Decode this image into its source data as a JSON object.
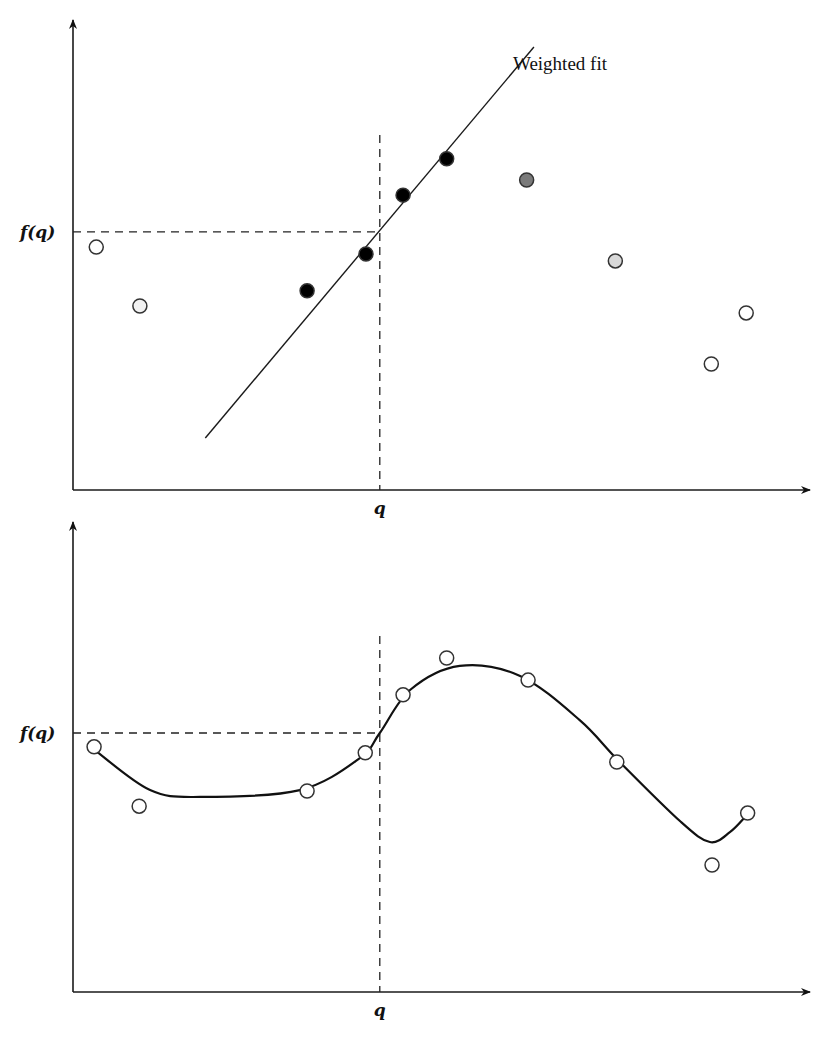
{
  "chart_data": [
    {
      "type": "scatter",
      "title": "",
      "panel": "top",
      "xlabel": "q",
      "ylabel": "f(q)",
      "xlim": [
        0,
        100
      ],
      "ylim": [
        0,
        100
      ],
      "grid": false,
      "query_x": 42.2,
      "query_y": 56.1,
      "query_x_label": "q",
      "query_y_label": "f(q)",
      "fit_line": {
        "label": "Weighted fit",
        "x": [
          18.2,
          63.4
        ],
        "y": [
          11.3,
          96.3
        ]
      },
      "series": [
        {
          "name": "points",
          "x": [
            3.2,
            9.2,
            32.2,
            40.3,
            45.4,
            51.4,
            62.4,
            74.6,
            87.8,
            92.6
          ],
          "y": [
            52.8,
            40.0,
            43.3,
            51.3,
            64.1,
            72.0,
            67.4,
            49.8,
            27.4,
            38.5
          ],
          "fill": [
            "#ffffff",
            "#f2f2f2",
            "#000000",
            "#000000",
            "#000000",
            "#000000",
            "#7a7a7a",
            "#d8d8d8",
            "#ffffff",
            "#ffffff"
          ]
        }
      ]
    },
    {
      "type": "line",
      "title": "",
      "panel": "bottom",
      "xlabel": "q",
      "ylabel": "f(q)",
      "xlim": [
        0,
        100
      ],
      "ylim": [
        0,
        100
      ],
      "grid": false,
      "query_x": 42.2,
      "query_y": 56.3,
      "query_x_label": "q",
      "query_y_label": "f(q)",
      "series": [
        {
          "name": "points",
          "x": [
            2.9,
            9.1,
            32.2,
            40.2,
            45.4,
            51.4,
            62.6,
            74.8,
            87.9,
            92.8
          ],
          "y": [
            53.3,
            40.4,
            43.7,
            52.0,
            64.6,
            72.6,
            67.8,
            50.0,
            27.6,
            38.9
          ],
          "fill": [
            "#ffffff",
            "#ffffff",
            "#ffffff",
            "#ffffff",
            "#ffffff",
            "#ffffff",
            "#ffffff",
            "#ffffff",
            "#ffffff",
            "#ffffff"
          ]
        },
        {
          "name": "local fit curve",
          "x": [
            3.0,
            10.6,
            17.5,
            31.2,
            39.5,
            42.2,
            46.4,
            53.2,
            61.5,
            69.7,
            75.2,
            83.6,
            87.6,
            90.4,
            92.6
          ],
          "y": [
            52.6,
            43.9,
            42.4,
            43.9,
            50.9,
            56.3,
            65.7,
            70.9,
            68.7,
            59.1,
            50.0,
            37.0,
            32.6,
            34.8,
            38.3
          ]
        }
      ]
    }
  ]
}
